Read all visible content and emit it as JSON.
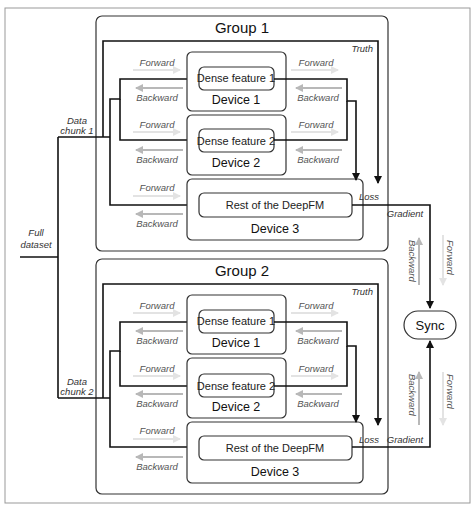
{
  "diagram": {
    "source": {
      "label_line1": "Full",
      "label_line2": "dataset"
    },
    "sync": {
      "label": "Sync"
    },
    "groups": [
      {
        "title": "Group 1",
        "chunk_label_line1": "Data",
        "chunk_label_line2": "chunk 1",
        "truth_label": "Truth",
        "loss_label": "Loss",
        "gradient_label": "Gradient",
        "devices": [
          {
            "name": "Device 1",
            "component": "Dense feature 1"
          },
          {
            "name": "Device 2",
            "component": "Dense feature 2"
          },
          {
            "name": "Device 3",
            "component": "Rest of the DeepFM"
          }
        ],
        "forward_label": "Forward",
        "backward_label": "Backward"
      },
      {
        "title": "Group 2",
        "chunk_label_line1": "Data",
        "chunk_label_line2": "chunk 2",
        "truth_label": "Truth",
        "loss_label": "Loss",
        "gradient_label": "Gradient",
        "devices": [
          {
            "name": "Device 1",
            "component": "Dense feature 1"
          },
          {
            "name": "Device 2",
            "component": "Dense feature 2"
          },
          {
            "name": "Device 3",
            "component": "Rest of the DeepFM"
          }
        ],
        "forward_label": "Forward",
        "backward_label": "Backward"
      }
    ],
    "sync_path_labels": {
      "forward": "Forward",
      "backward": "Backward"
    },
    "colors": {
      "line": "#111111",
      "ghost_arrow": "#b8b8b8",
      "faint_arrow": "#e3e3e3",
      "frame": "#999999"
    }
  }
}
